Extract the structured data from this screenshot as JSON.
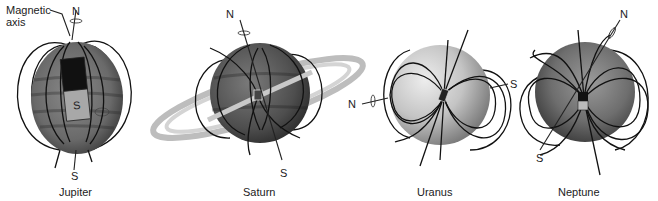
{
  "figure": {
    "annotation": {
      "line1": "Magnetic",
      "line2": "axis"
    },
    "planets": [
      {
        "name": "Jupiter",
        "north_label": "N",
        "south_label": "S",
        "magnet_label": "S"
      },
      {
        "name": "Saturn",
        "north_label": "N",
        "south_label": "S",
        "magnet_label": "S"
      },
      {
        "name": "Uranus",
        "north_label": "N",
        "south_label": "S",
        "magnet_label": "S"
      },
      {
        "name": "Neptune",
        "north_label": "N",
        "south_label": "S",
        "magnet_label": "S"
      }
    ]
  }
}
